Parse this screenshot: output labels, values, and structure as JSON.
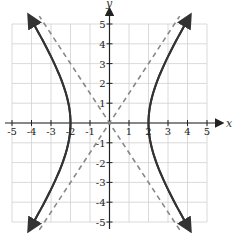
{
  "chart_data": {
    "type": "line",
    "title": "",
    "xlabel": "x",
    "ylabel": "y",
    "xlim": [
      -5,
      5
    ],
    "ylim": [
      -5,
      5
    ],
    "grid": true,
    "x_ticks": [
      "-5",
      "-4",
      "-3",
      "-2",
      "-1",
      "1",
      "2",
      "3",
      "4",
      "5"
    ],
    "y_ticks": [
      "5",
      "4",
      "3",
      "2",
      "1",
      "-1",
      "-2",
      "-3",
      "-4",
      "-5"
    ],
    "series": [
      {
        "name": "hyperbola",
        "equation": "x^2/4 - y^2/9 = 1",
        "style": "solid",
        "color": "#333333",
        "vertices": [
          [
            -2,
            0
          ],
          [
            2,
            0
          ]
        ]
      },
      {
        "name": "asymptote 1",
        "equation": "y = 1.5x",
        "style": "dashed",
        "color": "#888888"
      },
      {
        "name": "asymptote 2",
        "equation": "y = -1.5x",
        "style": "dashed",
        "color": "#888888"
      }
    ]
  },
  "labels": {
    "x_axis": "x",
    "y_axis": "y"
  }
}
